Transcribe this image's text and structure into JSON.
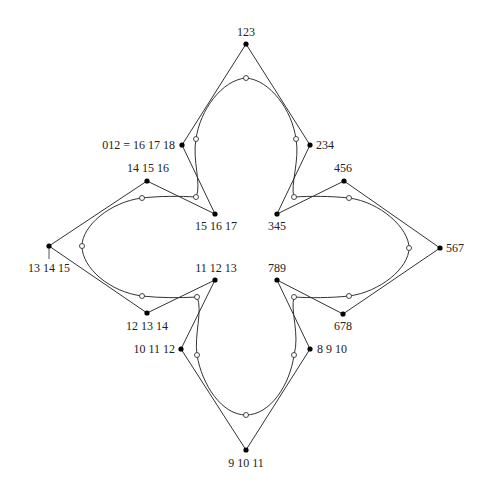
{
  "diagram": {
    "type": "B-spline control polygon with closed curve (four-leaf shape)",
    "control_points": [
      {
        "id": "p0",
        "label": "012 = 16 17 18",
        "x": 182,
        "y": 145
      },
      {
        "id": "p1",
        "label": "123",
        "x": 246,
        "y": 44
      },
      {
        "id": "p2",
        "label": "234",
        "x": 310,
        "y": 145
      },
      {
        "id": "p3",
        "label": "345",
        "x": 277,
        "y": 214
      },
      {
        "id": "p4",
        "label": "456",
        "x": 344,
        "y": 181
      },
      {
        "id": "p5",
        "label": "567",
        "x": 440,
        "y": 248
      },
      {
        "id": "p6",
        "label": "678",
        "x": 343,
        "y": 314
      },
      {
        "id": "p7",
        "label": "789",
        "x": 277,
        "y": 280
      },
      {
        "id": "p8",
        "label": "8 9 10",
        "x": 310,
        "y": 349
      },
      {
        "id": "p9",
        "label": "9 10 11",
        "x": 246,
        "y": 450
      },
      {
        "id": "p10",
        "label": "10 11 12",
        "x": 181,
        "y": 349
      },
      {
        "id": "p11",
        "label": "11 12 13",
        "x": 215,
        "y": 280
      },
      {
        "id": "p12",
        "label": "12 13 14",
        "x": 147,
        "y": 313
      },
      {
        "id": "p13",
        "label": "13 14 15",
        "x": 49,
        "y": 246
      },
      {
        "id": "p14",
        "label": "14 15 16",
        "x": 147,
        "y": 181
      },
      {
        "id": "p15",
        "label": "15 16 17",
        "x": 215,
        "y": 214
      }
    ],
    "curve_points": [
      {
        "x": 196,
        "y": 139
      },
      {
        "x": 246,
        "y": 78
      },
      {
        "x": 296,
        "y": 139
      },
      {
        "x": 294,
        "y": 197
      },
      {
        "x": 349,
        "y": 198
      },
      {
        "x": 409,
        "y": 248
      },
      {
        "x": 349,
        "y": 296
      },
      {
        "x": 294,
        "y": 297
      },
      {
        "x": 294,
        "y": 355
      },
      {
        "x": 246,
        "y": 415
      },
      {
        "x": 197,
        "y": 355
      },
      {
        "x": 197,
        "y": 297
      },
      {
        "x": 142,
        "y": 296
      },
      {
        "x": 82,
        "y": 246
      },
      {
        "x": 142,
        "y": 198
      },
      {
        "x": 196,
        "y": 197
      }
    ]
  },
  "labels": {
    "p0": "012 = 16 17 18",
    "p1": "123",
    "p2": "234",
    "p3": "345",
    "p4": "456",
    "p5": "567",
    "p6": "678",
    "p7": "789",
    "p8": "8 9 10",
    "p9": "9 10 11",
    "p10": "10 11 12",
    "p11": "11 12 13",
    "p12": "12 13 14",
    "p13": "13 14 15",
    "p14": "14 15 16",
    "p15": "15 16 17"
  },
  "colors": {
    "stroke": "#333333",
    "control_point_fill": "#000000",
    "curve_point_fill": "#ffffff",
    "background": "#ffffff"
  }
}
